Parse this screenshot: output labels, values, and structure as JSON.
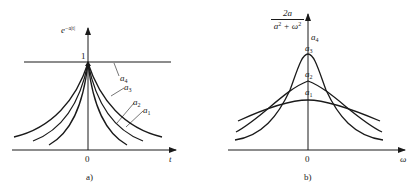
{
  "figure_a": {
    "ylabel": "e",
    "ylabel_exp": "−a|t|",
    "peak_label": "1",
    "xlabel": "t",
    "origin_label": "0",
    "caption": "a)",
    "curve_labels": [
      {
        "name": "a",
        "sub": "4"
      },
      {
        "name": "a",
        "sub": "3"
      },
      {
        "name": "a",
        "sub": "2"
      },
      {
        "name": "a",
        "sub": "1"
      }
    ]
  },
  "figure_b": {
    "ylabel_num": "2a",
    "ylabel_den_base": "a",
    "ylabel_den_rest": " + ω",
    "ylabel_sup": "2",
    "xlabel": "ω",
    "origin_label": "0",
    "caption": "b)",
    "curve_labels": [
      {
        "name": "a",
        "sub": "4"
      },
      {
        "name": "a",
        "sub": "3"
      },
      {
        "name": "a",
        "sub": "2"
      },
      {
        "name": "a",
        "sub": "1"
      }
    ]
  },
  "stroke_color": "#1a1a1a",
  "background_color": "#ffffff"
}
